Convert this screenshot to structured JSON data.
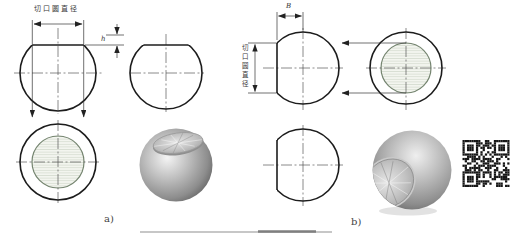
{
  "panel_a": {
    "caption": "a)",
    "dim_top_label": "切口圆直径",
    "dim_depth_label": "h"
  },
  "panel_b": {
    "caption": "b)",
    "dim_left_label": "切口圆直径",
    "dim_depth_label": "B"
  },
  "colors": {
    "outline": "#1c1c1c",
    "centerline": "#4a4a4a",
    "dimension": "#333333",
    "cut_stroke": "#74846f",
    "cut_fill": "#f3f5ef",
    "cut_hatch": "#c2cabb",
    "qr_dark": "#161616"
  }
}
